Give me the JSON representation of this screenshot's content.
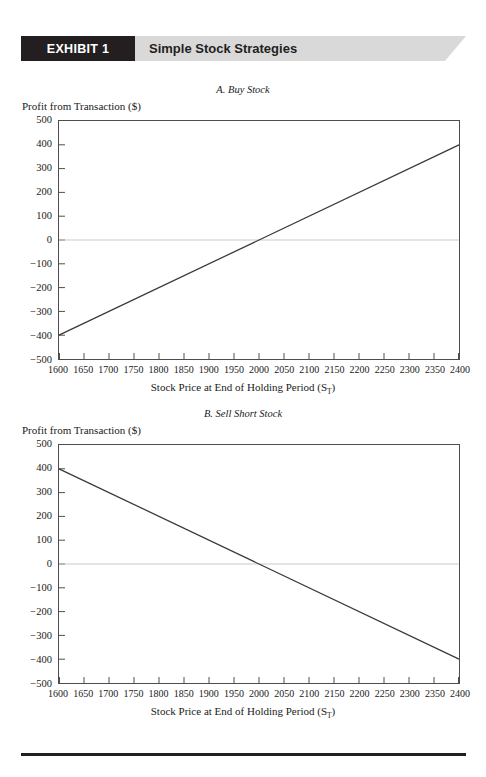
{
  "banner": {
    "tag": "EXHIBIT 1",
    "title": "Simple Stock Strategies",
    "tag_color": "#231f20",
    "band_color": "#d9d9d9"
  },
  "charts": [
    {
      "id": "A",
      "caption": "A. Buy Stock",
      "ylabel": "Profit from Transaction ($)",
      "xlabel_prefix": "Stock Price at End of Holding Period (S",
      "xlabel_sub": "T",
      "xlabel_suffix": ")"
    },
    {
      "id": "B",
      "caption": "B. Sell Short Stock",
      "ylabel": "Profit from Transaction ($)",
      "xlabel_prefix": "Stock Price at End of Holding Period (S",
      "xlabel_sub": "T",
      "xlabel_suffix": ")"
    }
  ],
  "chart_data": [
    {
      "type": "line",
      "title": "A. Buy Stock",
      "xlabel": "Stock Price at End of Holding Period (ST)",
      "ylabel": "Profit from Transaction ($)",
      "xlim": [
        1600,
        2400
      ],
      "ylim": [
        -500,
        500
      ],
      "xticks": [
        1600,
        1650,
        1700,
        1750,
        1800,
        1850,
        1900,
        1950,
        2000,
        2050,
        2100,
        2150,
        2200,
        2250,
        2300,
        2350,
        2400
      ],
      "yticks": [
        500,
        400,
        300,
        200,
        100,
        0,
        -100,
        -200,
        -300,
        -400,
        -500
      ],
      "grid": false,
      "legend": "none",
      "zero_line": true,
      "series": [
        {
          "name": "Buy Stock profit",
          "x": [
            1600,
            2400
          ],
          "values": [
            -400,
            400
          ],
          "color": "#3a3a3a"
        }
      ]
    },
    {
      "type": "line",
      "title": "B. Sell Short Stock",
      "xlabel": "Stock Price at End of Holding Period (ST)",
      "ylabel": "Profit from Transaction ($)",
      "xlim": [
        1600,
        2400
      ],
      "ylim": [
        -500,
        500
      ],
      "xticks": [
        1600,
        1650,
        1700,
        1750,
        1800,
        1850,
        1900,
        1950,
        2000,
        2050,
        2100,
        2150,
        2200,
        2250,
        2300,
        2350,
        2400
      ],
      "yticks": [
        500,
        400,
        300,
        200,
        100,
        0,
        -100,
        -200,
        -300,
        -400,
        -500
      ],
      "grid": false,
      "legend": "none",
      "zero_line": true,
      "series": [
        {
          "name": "Sell Short Stock profit",
          "x": [
            1600,
            2400
          ],
          "values": [
            400,
            -400
          ],
          "color": "#3a3a3a"
        }
      ]
    }
  ],
  "ytick_labels": [
    "500",
    "400",
    "300",
    "200",
    "100",
    "0",
    "−100",
    "−200",
    "−300",
    "−400",
    "−500"
  ],
  "xtick_labels": [
    "1600",
    "1650",
    "1700",
    "1750",
    "1800",
    "1850",
    "1900",
    "1950",
    "2000",
    "2050",
    "2100",
    "2150",
    "2200",
    "2250",
    "2300",
    "2350",
    "2400"
  ]
}
